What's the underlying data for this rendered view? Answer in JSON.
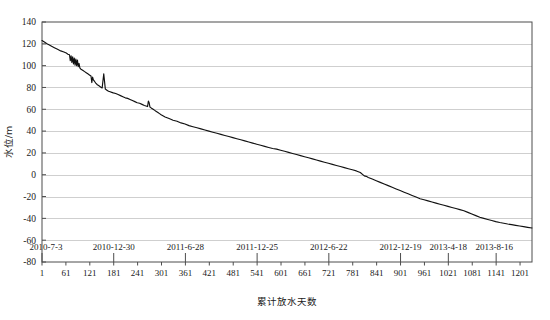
{
  "chart_data": {
    "type": "line",
    "title": "",
    "xlabel": "累计放水天数",
    "ylabel": "水位/m",
    "xlim": [
      1,
      1231
    ],
    "ylim": [
      -80,
      140
    ],
    "ytick_labels": [
      "140",
      "120",
      "100",
      "80",
      "60",
      "40",
      "20",
      "0",
      "-20",
      "-40",
      "-60",
      "-80"
    ],
    "ytick_values": [
      140,
      120,
      100,
      80,
      60,
      40,
      20,
      0,
      -20,
      -40,
      -60,
      -80
    ],
    "xtick_labels": [
      "1",
      "61",
      "121",
      "181",
      "241",
      "301",
      "361",
      "421",
      "481",
      "541",
      "601",
      "661",
      "721",
      "781",
      "841",
      "901",
      "961",
      "1021",
      "1081",
      "1141",
      "1201"
    ],
    "xtick_values": [
      1,
      61,
      121,
      181,
      241,
      301,
      361,
      421,
      481,
      541,
      601,
      661,
      721,
      781,
      841,
      901,
      961,
      1021,
      1081,
      1141,
      1201
    ],
    "date_tick_labels": [
      "2010-7-3",
      "2010-12-30",
      "2011-6-28",
      "2011-12-25",
      "2012-6-22",
      "2012-12-19",
      "2013-4-18",
      "2013-8-16"
    ],
    "date_tick_values": [
      1,
      181,
      361,
      541,
      721,
      901,
      1021,
      1141
    ],
    "grid": true,
    "grid_axis": "y",
    "legend": false,
    "series": [
      {
        "name": "水位",
        "color": "#111111",
        "x": [
          1,
          8,
          16,
          24,
          32,
          40,
          48,
          56,
          62,
          66,
          70,
          72,
          74,
          76,
          78,
          80,
          82,
          84,
          86,
          88,
          90,
          92,
          94,
          96,
          98,
          100,
          104,
          108,
          112,
          116,
          120,
          124,
          126,
          128,
          130,
          132,
          134,
          136,
          140,
          144,
          148,
          152,
          156,
          160,
          164,
          168,
          172,
          176,
          180,
          186,
          192,
          198,
          204,
          210,
          216,
          222,
          228,
          234,
          240,
          246,
          252,
          258,
          262,
          266,
          268,
          270,
          272,
          274,
          276,
          278,
          280,
          284,
          288,
          292,
          296,
          300,
          310,
          320,
          330,
          340,
          350,
          360,
          370,
          380,
          390,
          400,
          410,
          420,
          430,
          440,
          450,
          460,
          470,
          480,
          490,
          500,
          510,
          520,
          530,
          540,
          550,
          560,
          570,
          580,
          590,
          600,
          610,
          620,
          630,
          640,
          650,
          660,
          670,
          680,
          690,
          700,
          710,
          720,
          730,
          740,
          750,
          760,
          770,
          780,
          790,
          800,
          810,
          815,
          820,
          830,
          840,
          850,
          860,
          870,
          880,
          890,
          900,
          910,
          920,
          930,
          940,
          950,
          960,
          970,
          980,
          990,
          1000,
          1010,
          1020,
          1030,
          1040,
          1050,
          1060,
          1070,
          1080,
          1090,
          1100,
          1110,
          1120,
          1130,
          1140,
          1150,
          1160,
          1170,
          1180,
          1190,
          1200,
          1210,
          1220,
          1231
        ],
        "y": [
          123.0,
          121.5,
          119.5,
          118.0,
          116.5,
          115.0,
          113.5,
          112.5,
          111.5,
          110.5,
          110.0,
          104.5,
          109.0,
          103.0,
          108.0,
          101.5,
          107.0,
          100.5,
          106.0,
          100.0,
          105.0,
          99.0,
          102.0,
          98.0,
          97.0,
          96.5,
          95.5,
          94.5,
          93.5,
          92.5,
          91.5,
          90.5,
          84.5,
          89.5,
          87.0,
          86.0,
          85.0,
          84.0,
          82.5,
          81.5,
          80.5,
          79.5,
          92.5,
          78.5,
          77.5,
          76.5,
          76.0,
          75.5,
          75.0,
          74.5,
          73.5,
          72.5,
          71.5,
          70.5,
          70.0,
          69.0,
          68.0,
          67.0,
          66.0,
          65.5,
          64.5,
          63.5,
          63.0,
          62.5,
          67.5,
          66.0,
          62.0,
          61.5,
          61.0,
          60.5,
          60.0,
          59.0,
          58.0,
          57.0,
          56.0,
          55.0,
          53.0,
          51.5,
          50.0,
          49.0,
          47.5,
          46.5,
          45.0,
          44.0,
          43.0,
          42.0,
          41.0,
          40.0,
          39.0,
          38.0,
          37.0,
          36.0,
          35.0,
          34.0,
          33.0,
          32.0,
          31.0,
          30.0,
          29.0,
          28.0,
          27.0,
          26.0,
          25.0,
          24.0,
          23.5,
          22.5,
          21.5,
          20.5,
          19.5,
          18.5,
          17.5,
          16.5,
          15.5,
          14.5,
          13.5,
          12.5,
          11.5,
          10.5,
          9.5,
          8.5,
          7.5,
          6.5,
          5.5,
          4.5,
          3.5,
          2.0,
          -1.0,
          -1.5,
          -2.5,
          -4.0,
          -5.5,
          -7.0,
          -8.5,
          -10.0,
          -11.5,
          -13.0,
          -14.5,
          -16.0,
          -17.5,
          -19.0,
          -20.5,
          -22.0,
          -23.0,
          -24.0,
          -25.0,
          -26.0,
          -27.0,
          -28.0,
          -29.0,
          -30.0,
          -31.0,
          -32.0,
          -33.0,
          -34.5,
          -36.0,
          -37.5,
          -39.0,
          -40.0,
          -41.0,
          -42.0,
          -43.0,
          -43.8,
          -44.5,
          -45.2,
          -45.8,
          -46.4,
          -47.0,
          -47.6,
          -48.2,
          -48.8
        ]
      }
    ]
  },
  "axis": {
    "y_title": "水位/m",
    "x_title": "累计放水天数"
  }
}
